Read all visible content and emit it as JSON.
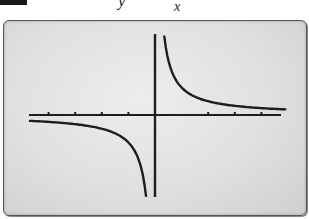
{
  "figure": {
    "equation_top": "y",
    "equation_denominator": "x"
  },
  "chart_data": {
    "type": "line",
    "xlabel": "",
    "ylabel": "",
    "xlim": [
      -4.7,
      4.7
    ],
    "ylim": [
      -3.1,
      3.1
    ],
    "x_ticks": [
      -4,
      -3,
      -2,
      -1,
      1,
      2,
      3,
      4
    ],
    "grid": false,
    "legend": false,
    "series": [
      {
        "name": "left branch",
        "x": [
          -4.7,
          -4,
          -3,
          -2,
          -1,
          -0.5,
          -0.35
        ],
        "y": [
          -0.21,
          -0.25,
          -0.33,
          -0.5,
          -1.0,
          -2.0,
          -2.9
        ]
      },
      {
        "name": "right branch",
        "x": [
          0.45,
          0.5,
          1,
          2,
          3,
          4,
          4.7
        ],
        "y": [
          2.9,
          2.0,
          1.0,
          0.5,
          0.33,
          0.25,
          0.21
        ]
      }
    ],
    "asymptotes": {
      "vertical": 0,
      "horizontal": 0
    }
  },
  "colors": {
    "screen_bg": "#e3e3e3",
    "curve": "#1e1e1e",
    "axis": "#1e1e1e",
    "frame": "#555555"
  }
}
